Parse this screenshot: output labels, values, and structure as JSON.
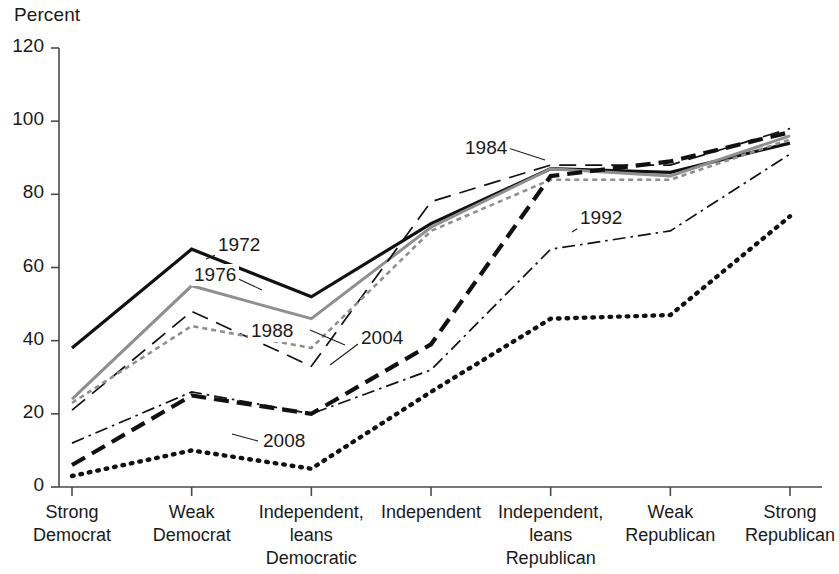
{
  "chart_data": {
    "type": "line",
    "title": "",
    "ylabel": "Percent",
    "xlabel": "",
    "ylim": [
      0,
      120
    ],
    "yticks": [
      0,
      20,
      40,
      60,
      80,
      100,
      120
    ],
    "grid": false,
    "legend_position": "inline-annotations",
    "categories": [
      "Strong\nDemocrat",
      "Weak\nDemocrat",
      "Independent,\nleans\nDemocratic",
      "Independent",
      "Independent,\nleans\nRepublican",
      "Weak\nRepublican",
      "Strong\nRepublican"
    ],
    "category_lines": [
      [
        "Strong",
        "Democrat"
      ],
      [
        "Weak",
        "Democrat"
      ],
      [
        "Independent,",
        "leans",
        "Democratic"
      ],
      [
        "Independent"
      ],
      [
        "Independent,",
        "leans",
        "Republican"
      ],
      [
        "Weak",
        "Republican"
      ],
      [
        "Strong",
        "Republican"
      ]
    ],
    "series": [
      {
        "name": "1972",
        "style": "solid-black",
        "values": [
          38,
          65,
          52,
          72,
          87,
          86,
          94
        ]
      },
      {
        "name": "1976",
        "style": "solid-gray",
        "values": [
          24,
          55,
          46,
          71,
          87,
          85,
          96
        ]
      },
      {
        "name": "1984",
        "style": "dashed-long",
        "values": [
          21,
          48,
          33,
          78,
          88,
          88,
          98
        ]
      },
      {
        "name": "1988",
        "style": "dotted-gray",
        "values": [
          23,
          44,
          38,
          70,
          84,
          84,
          95
        ]
      },
      {
        "name": "1992",
        "style": "dash-dot",
        "values": [
          12,
          26,
          20,
          32,
          65,
          70,
          91
        ]
      },
      {
        "name": "2004",
        "style": "dashed-bold",
        "values": [
          6,
          25,
          20,
          39,
          85,
          89,
          97
        ]
      },
      {
        "name": "2008",
        "style": "dotted-bold",
        "values": [
          3,
          10,
          5,
          26,
          46,
          47,
          74
        ]
      }
    ],
    "annotations": [
      {
        "label": "1972",
        "x": 215,
        "y": 234
      },
      {
        "label": "1976",
        "x": 191,
        "y": 264
      },
      {
        "label": "1988",
        "x": 248,
        "y": 320
      },
      {
        "label": "2004",
        "x": 358,
        "y": 327
      },
      {
        "label": "1984",
        "x": 462,
        "y": 137
      },
      {
        "label": "1992",
        "x": 577,
        "y": 207
      },
      {
        "label": "2008",
        "x": 260,
        "y": 430
      }
    ],
    "colors": {
      "axis": "#4a4a4a",
      "black_series": "#111111",
      "gray_series": "#8f8f8f",
      "text": "#1a1a1a"
    }
  }
}
